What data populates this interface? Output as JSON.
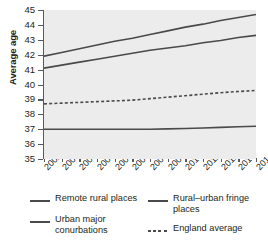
{
  "chart_data": {
    "type": "line",
    "title": "",
    "xlabel": "",
    "ylabel": "Average age",
    "x": [
      2002,
      2003,
      2004,
      2005,
      2006,
      2007,
      2008,
      2009,
      2010,
      2011,
      2012,
      2013,
      2014
    ],
    "categories": [
      "2002",
      "2003",
      "2004",
      "2005",
      "2006",
      "2007",
      "2008",
      "2009",
      "2010",
      "2011",
      "2012",
      "2013",
      "2014"
    ],
    "ylim": [
      35,
      45
    ],
    "yticks": [
      35,
      36,
      37,
      38,
      39,
      40,
      41,
      42,
      43,
      44,
      45
    ],
    "ytick_labels": [
      "35",
      "36",
      "37",
      "38",
      "39",
      "40",
      "41",
      "42",
      "43",
      "44",
      "45"
    ],
    "grid": false,
    "legend_position": "bottom",
    "series": [
      {
        "name": "Remote rural places",
        "style": "solid",
        "color": "#4a4a4a",
        "values": [
          41.9,
          42.15,
          42.4,
          42.65,
          42.9,
          43.1,
          43.35,
          43.6,
          43.85,
          44.05,
          44.3,
          44.5,
          44.7
        ]
      },
      {
        "name": "Rural–urban fringe places",
        "style": "solid",
        "color": "#4a4a4a",
        "values": [
          41.1,
          41.3,
          41.5,
          41.7,
          41.9,
          42.1,
          42.3,
          42.45,
          42.6,
          42.8,
          42.95,
          43.15,
          43.3
        ]
      },
      {
        "name": "England average",
        "style": "dashed",
        "color": "#4a4a4a",
        "values": [
          38.7,
          38.75,
          38.8,
          38.85,
          38.9,
          38.95,
          39.05,
          39.15,
          39.25,
          39.35,
          39.45,
          39.53,
          39.6
        ]
      },
      {
        "name": "Urban major conurbations",
        "style": "solid",
        "color": "#4a4a4a",
        "values": [
          37.0,
          37.0,
          37.0,
          37.0,
          37.0,
          37.0,
          37.0,
          37.02,
          37.05,
          37.08,
          37.12,
          37.16,
          37.2
        ]
      }
    ]
  },
  "legend": {
    "items": [
      {
        "label": "Remote rural places",
        "style": "solid"
      },
      {
        "label": "Rural–urban fringe places",
        "style": "solid"
      },
      {
        "label": "Urban major conurbations",
        "style": "solid"
      },
      {
        "label": "England average",
        "style": "dashed"
      }
    ]
  },
  "plot": {
    "background_color": "#ececec",
    "line_color": "#4a4a4a",
    "axis_color": "#58595b"
  }
}
